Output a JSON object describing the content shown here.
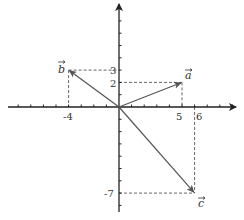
{
  "diagram": {
    "type": "vector-coordinate-plane",
    "origin_px": [
      119,
      107
    ],
    "unit_px": [
      12.6,
      12.3
    ],
    "colors": {
      "axis": "#222222",
      "vector": "#555555",
      "dashed": "#666666",
      "text": "#333333"
    },
    "x_ticks": [
      -8,
      -7,
      -6,
      -5,
      -4,
      -3,
      -2,
      -1,
      1,
      2,
      3,
      4,
      5,
      6,
      7,
      8,
      9
    ],
    "y_ticks": [
      -8,
      -7,
      -6,
      -5,
      -4,
      -3,
      -2,
      -1,
      1,
      2,
      3,
      4,
      5,
      6,
      7,
      8
    ],
    "tick_labels": {
      "x_neg4": "-4",
      "x_5": "5",
      "x_6": "6",
      "y_3": "3",
      "y_2": "2",
      "y_neg7": "-7"
    },
    "vectors": [
      {
        "name": "a",
        "label": "a",
        "components": [
          5,
          2
        ]
      },
      {
        "name": "b",
        "label": "b",
        "components": [
          -4,
          3
        ]
      },
      {
        "name": "c",
        "label": "c",
        "components": [
          6,
          -7
        ]
      }
    ]
  }
}
